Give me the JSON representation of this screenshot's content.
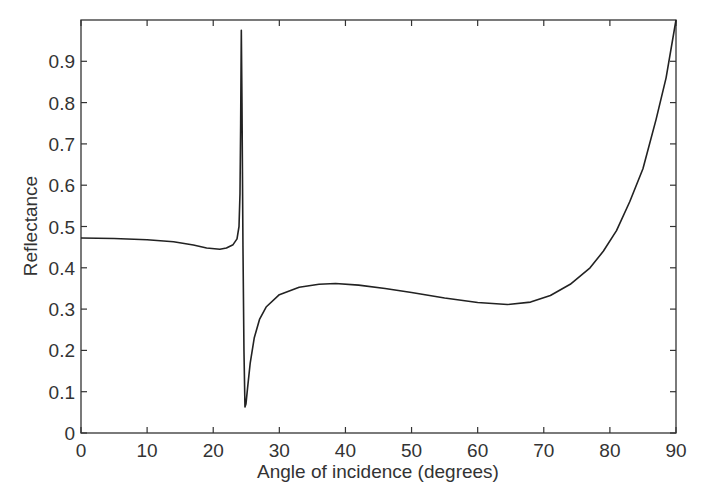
{
  "chart_data": {
    "type": "line",
    "title": "",
    "xlabel": "Angle of incidence (degrees)",
    "ylabel": "Reflectance",
    "xlim": [
      0,
      90
    ],
    "ylim": [
      0,
      1.0
    ],
    "grid": false,
    "legend": null,
    "xticks": [
      0,
      10,
      20,
      30,
      40,
      50,
      60,
      70,
      80,
      90
    ],
    "xtick_labels": [
      "0",
      "10",
      "20",
      "30",
      "40",
      "50",
      "60",
      "70",
      "80",
      "90"
    ],
    "yticks": [
      0,
      0.1,
      0.2,
      0.3,
      0.4,
      0.5,
      0.6,
      0.7,
      0.8,
      0.9
    ],
    "ytick_labels": [
      "0",
      "0.1",
      "0.2",
      "0.3",
      "0.4",
      "0.5",
      "0.6",
      "0.7",
      "0.8",
      "0.9"
    ],
    "series": [
      {
        "name": "Reflectance",
        "color": "#222222",
        "x": [
          0,
          5,
          10,
          14,
          17,
          19,
          21,
          22,
          23,
          23.6,
          23.9,
          24.05,
          24.15,
          24.25,
          24.35,
          24.5,
          24.65,
          24.8,
          24.95,
          25.2,
          25.6,
          26.2,
          27,
          28,
          30,
          33,
          36,
          38.5,
          42,
          46,
          50,
          55,
          60,
          64.5,
          68,
          71,
          74,
          77,
          79,
          81,
          83,
          85,
          87,
          88.5,
          90
        ],
        "y": [
          0.472,
          0.471,
          0.468,
          0.463,
          0.455,
          0.448,
          0.445,
          0.448,
          0.456,
          0.47,
          0.5,
          0.58,
          0.75,
          0.975,
          0.8,
          0.45,
          0.2,
          0.063,
          0.07,
          0.11,
          0.17,
          0.23,
          0.275,
          0.305,
          0.335,
          0.353,
          0.36,
          0.362,
          0.358,
          0.35,
          0.34,
          0.327,
          0.316,
          0.311,
          0.317,
          0.333,
          0.36,
          0.4,
          0.44,
          0.49,
          0.56,
          0.64,
          0.76,
          0.86,
          1.0
        ]
      }
    ]
  },
  "colors": {
    "axis": "#333333",
    "line": "#222222",
    "background": "#ffffff"
  }
}
